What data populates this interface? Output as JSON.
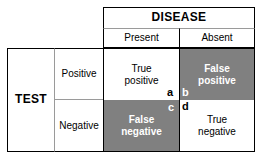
{
  "figure": {
    "type": "2x2-contingency-table",
    "title_column": "DISEASE",
    "title_row": "TEST"
  },
  "column_header": {
    "group_label": "DISEASE",
    "columns": [
      {
        "label": "Present"
      },
      {
        "label": "Absent"
      }
    ]
  },
  "row_header": {
    "group_label": "TEST",
    "rows": [
      {
        "label": "Positive"
      },
      {
        "label": "Negative"
      }
    ]
  },
  "cells": {
    "true_positive": {
      "label": "True\npositive",
      "marker": "a",
      "shaded": false
    },
    "false_positive": {
      "label": "False\npositive",
      "marker": "b",
      "shaded": true
    },
    "false_negative": {
      "label": "False\nnegative",
      "marker": "c",
      "shaded": true
    },
    "true_negative": {
      "label": "True\nnegative",
      "marker": "d",
      "shaded": false
    }
  },
  "colors": {
    "shaded_fill": "#808080",
    "plain_fill": "#ffffff",
    "border": "#000000",
    "inner_border": "#9a9a9a",
    "shaded_text": "#ffffff",
    "plain_text": "#000000"
  }
}
